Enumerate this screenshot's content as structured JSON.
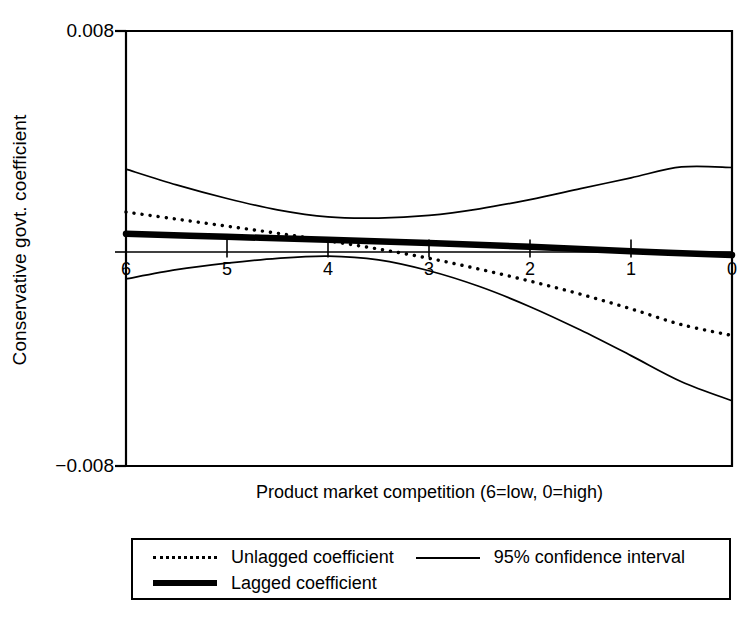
{
  "chart_data": {
    "type": "line",
    "title": "",
    "xlabel": "Product market competition (6=low, 0=high)",
    "ylabel": "Conservative govt. coefficient",
    "xlim": [
      6,
      0
    ],
    "ylim": [
      -0.008,
      0.008
    ],
    "x_ticks": [
      "6",
      "5",
      "4",
      "3",
      "2",
      "1",
      "0"
    ],
    "x_tick_values": [
      6,
      5,
      4,
      3,
      2,
      1,
      0
    ],
    "y_ticks": [
      "0.008",
      "0"
    ],
    "y_tick_bottom": "−0.008",
    "grid": false,
    "zero_line": true,
    "legend_position": "below-plot",
    "series": [
      {
        "name": "Unlagged coefficient",
        "style": "dotted",
        "x": [
          6,
          5.5,
          5,
          4.5,
          4,
          3.5,
          3,
          2.5,
          2,
          1.5,
          1,
          0.5,
          0
        ],
        "values": [
          0.00134,
          0.00108,
          0.00082,
          0.00056,
          0.00028,
          -2e-05,
          -0.00036,
          -0.00076,
          -0.0012,
          -0.00168,
          -0.00222,
          -0.0028,
          -0.0032
        ]
      },
      {
        "name": "Lagged coefficient",
        "style": "thick-solid",
        "x": [
          6,
          5,
          4,
          3,
          2,
          1,
          0
        ],
        "values": [
          0.00054,
          0.00043,
          0.00032,
          0.0002,
          6e-05,
          -0.0001,
          -0.00024
        ]
      },
      {
        "name": "95% confidence interval",
        "style": "thin-solid",
        "bound": "upper",
        "x": [
          6,
          5.5,
          5,
          4.5,
          4,
          3.5,
          3,
          2.5,
          2,
          1.5,
          1,
          0.5,
          0
        ],
        "values": [
          0.00292,
          0.00234,
          0.00184,
          0.00142,
          0.00116,
          0.00112,
          0.00122,
          0.00146,
          0.0018,
          0.0022,
          0.0026,
          0.003,
          0.00298
        ]
      },
      {
        "name": "95% confidence interval",
        "style": "thin-solid",
        "bound": "lower",
        "x": [
          6,
          5.5,
          5,
          4.5,
          4,
          3.5,
          3,
          2.5,
          2,
          1.5,
          1,
          0.5,
          0
        ],
        "values": [
          -0.00112,
          -0.00078,
          -0.00054,
          -0.00036,
          -0.00028,
          -0.00042,
          -0.00082,
          -0.0014,
          -0.00214,
          -0.003,
          -0.00394,
          -0.0049,
          -0.0056
        ]
      }
    ]
  },
  "legend": {
    "items": [
      {
        "label": "Unlagged coefficient",
        "style": "dotted"
      },
      {
        "label": "95% confidence interval",
        "style": "thin-solid"
      },
      {
        "label": "Lagged coefficient",
        "style": "thick-solid"
      }
    ]
  },
  "colors": {
    "line": "#000000",
    "axis": "#000000",
    "background": "#ffffff"
  }
}
